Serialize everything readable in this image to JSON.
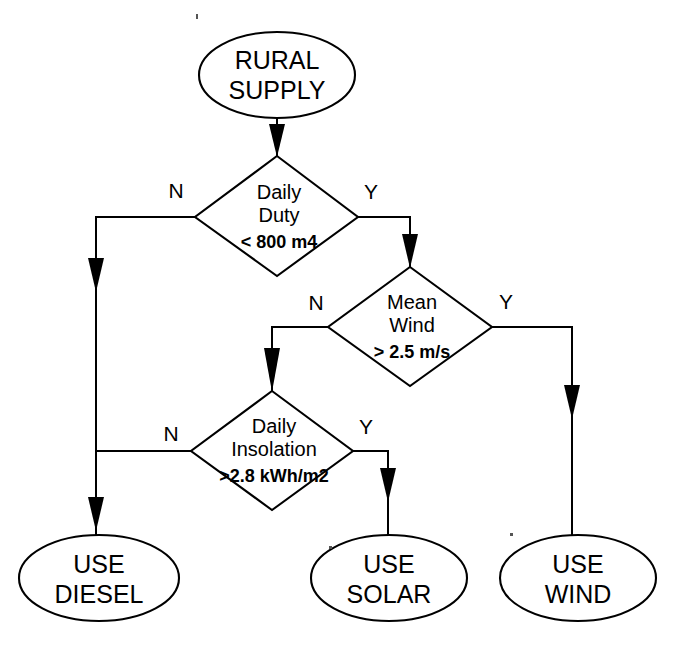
{
  "diagram": {
    "type": "flowchart",
    "line_color": "#000000",
    "fill_color": "#ffffff",
    "background": "#ffffff"
  },
  "nodes": {
    "start": {
      "id": "rural-supply",
      "shape": "ellipse",
      "line1": "RURAL",
      "line2": "SUPPLY"
    },
    "decision_duty": {
      "id": "daily-duty",
      "shape": "diamond",
      "line1": "Daily",
      "line2": "Duty",
      "condition": "< 800 m4"
    },
    "decision_wind": {
      "id": "mean-wind",
      "shape": "diamond",
      "line1": "Mean",
      "line2": "Wind",
      "condition": "> 2.5 m/s"
    },
    "decision_insolation": {
      "id": "daily-insolation",
      "shape": "diamond",
      "line1": "Daily",
      "line2": "Insolation",
      "condition": ">2.8 kWh/m2"
    },
    "end_diesel": {
      "id": "use-diesel",
      "shape": "ellipse",
      "line1": "USE",
      "line2": "DIESEL"
    },
    "end_solar": {
      "id": "use-solar",
      "shape": "ellipse",
      "line1": "USE",
      "line2": "SOLAR"
    },
    "end_wind": {
      "id": "use-wind",
      "shape": "ellipse",
      "line1": "USE",
      "line2": "WIND"
    }
  },
  "branch_labels": {
    "duty_no": "N",
    "duty_yes": "Y",
    "wind_no": "N",
    "wind_yes": "Y",
    "insolation_no": "N",
    "insolation_yes": "Y"
  },
  "edges": [
    {
      "from": "rural-supply",
      "to": "daily-duty",
      "label": ""
    },
    {
      "from": "daily-duty",
      "to": "use-diesel",
      "label": "N"
    },
    {
      "from": "daily-duty",
      "to": "mean-wind",
      "label": "Y"
    },
    {
      "from": "mean-wind",
      "to": "daily-insolation",
      "label": "N"
    },
    {
      "from": "mean-wind",
      "to": "use-wind",
      "label": "Y"
    },
    {
      "from": "daily-insolation",
      "to": "use-diesel",
      "label": "N"
    },
    {
      "from": "daily-insolation",
      "to": "use-solar",
      "label": "Y"
    }
  ]
}
